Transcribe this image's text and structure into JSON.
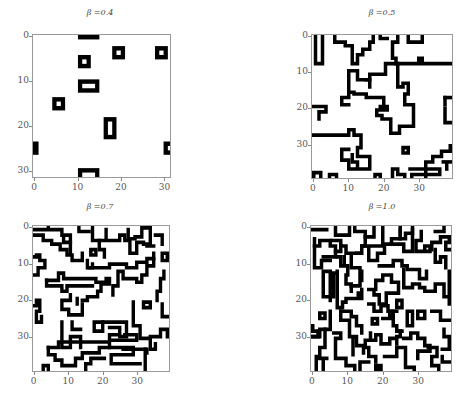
{
  "chart_data": [
    {
      "type": "heatmap",
      "title": "β =0.4",
      "grid_size": 32,
      "xlim": [
        0,
        31
      ],
      "ylim": [
        31,
        0
      ],
      "xticks": [
        "0",
        "10",
        "20",
        "30"
      ],
      "yticks": [
        "0",
        "10",
        "20",
        "30"
      ],
      "colormap": [
        "#ffffff",
        "#000000"
      ],
      "description": "Sparse isolated black rectangular domain walls on white background",
      "walls": [
        {
          "shape": "rect",
          "x": 10,
          "y": -1,
          "w": 5,
          "h": 1.5
        },
        {
          "shape": "rect",
          "x": 18,
          "y": 2,
          "w": 3,
          "h": 3
        },
        {
          "shape": "rect",
          "x": 28,
          "y": 2,
          "w": 3,
          "h": 3
        },
        {
          "shape": "rect",
          "x": 10,
          "y": 4,
          "w": 3,
          "h": 3
        },
        {
          "shape": "rect",
          "x": 10,
          "y": 9.5,
          "w": 5,
          "h": 3
        },
        {
          "shape": "rect",
          "x": 4,
          "y": 13.5,
          "w": 3,
          "h": 3
        },
        {
          "shape": "rect",
          "x": 16,
          "y": 18,
          "w": 3,
          "h": 5
        },
        {
          "shape": "rect",
          "x": -1,
          "y": 23.5,
          "w": 1.8,
          "h": 3
        },
        {
          "shape": "rect",
          "x": 30,
          "y": 23.5,
          "w": 3,
          "h": 3
        },
        {
          "shape": "rect",
          "x": 10,
          "y": 29.5,
          "w": 5,
          "h": 3
        }
      ]
    },
    {
      "type": "heatmap",
      "title": "β =0.5",
      "grid_size": 40,
      "xlim": [
        0,
        39
      ],
      "ylim": [
        39,
        0
      ],
      "xticks": [
        "0",
        "10",
        "20",
        "30"
      ],
      "yticks": [
        "0",
        "10",
        "20",
        "30"
      ],
      "colormap": [
        "#ffffff",
        "#000000"
      ],
      "description": "Larger connected domain wall network",
      "paths": [
        "M0.5,-1 V7.5 H2.5 V-1",
        "M6,-1 V1.5 H9 V2.5 H11 V7.5 H12.5 V5 H14 V3.5 H16 V1.5 H17 V-1",
        "M19,-1 V0.5 H21",
        "M24,-1 V1.5 H22.5 V6 H23.5 V7.5 H20.5 V10.5 H16 V12 H15",
        "M27,-1 V1.5 H31 V-1",
        "M23.5,7.5 H30 V6 H31 V7.5 H41",
        "M10,9.5 H12.5 V12 H16 V14",
        "M10,9.5 V17 H8 V19 H10",
        "M10,15.5 H11.5 V16 H15 V17 H20 V20",
        "M24,7.5 V14 H25.5 V13 H27 V16 H26 V19 H28.5 V25 H24.5 V27 H22 V23 H19.5 V22 H18 V20.5 H21 V19.5 H19",
        "M-1,16.5 V18",
        "M-1,19.5 H3.5 V21 H1.5 V23",
        "M-1,27.5 H10 V26 H11.5 V27.5 H13.5 V31 H12.5 V33.5 H16 V37 H10 V34.5 H8 V31.5 H10",
        "M11,33 V35 H12.5 V36.5",
        "M25.5,31 H27 V32.5 H25.5 Z",
        "M37.5,17 H41",
        "M37.5,17 V19",
        "M37.5,20 V24 H41",
        "M39,30.5 V32 H36.5 V33.5 H34 V35 H32 V40",
        "M37,35 H41",
        "M-1,35.5 V37",
        "M0,38.5 V40 M0,38 H2 V40",
        "M4.5,40 V38.5 H6.5 V40",
        "M17.5,40 V38.5 H19 V40",
        "M22.5,40 V37 H24 V38.5 H26 V40",
        "M27.5,37 H36 V38.5 H28 V40",
        "M38,35.5 V37"
      ]
    },
    {
      "type": "heatmap",
      "title": "β =0.7",
      "grid_size": 40,
      "xlim": [
        0,
        39
      ],
      "ylim": [
        39,
        0
      ],
      "xticks": [
        "0",
        "10",
        "20",
        "30"
      ],
      "yticks": [
        "0",
        "10",
        "20",
        "30"
      ],
      "colormap": [
        "#ffffff",
        "#000000"
      ],
      "description": "Dense domain wall network",
      "paths": [
        "M-1,0.5 H3 M4,-1 V0.5 H8 V2",
        "M0,2 H2.5 V3.5 H5 V4.5 H7.5 V6 H9.5 V7.5 H11 V9 H14 V7",
        "M8.5,2 V4 H10.5 V2 H8.5",
        "M10.5,4 V7 M13,-1 V1 H16",
        "M17,0 V3.5 H19 V6 H20.5 V8",
        "M19,3.5 H21 V0.5 M21,3.5 H25 V2 H26.5 V3.5 H28 V7 H30 V4 H32",
        "M27.5,0.5 V3 H29.5 V2.5 H31.5 V0 H34 V2 M33,5 H35 M34,2 V4.5 H32",
        "M35.5,2 H37.5 V4.5",
        "M-1,8 H0.5 V7.5 H1.5 V9 H3 V11 H1 V13 H-1",
        "M16.5,6 H18 V7.5 H16.5 Z",
        "M15.5,9 V11 H17 V10",
        "M16,11 H22 V10 H27 V11 H30 V9.5 H33 V8.5 H35",
        "M35,7 V10.5 H33 V13 H31.5 V15 H30 V14 H26 V12 H24.5 V16 H23 V18.5",
        "M37.5,7 H39 V9 H37.5 Z",
        "M3.5,14.5 H7 V12.5 H8.5 V14 H18 V15 H21 V14 H22 V15.5 H19.5 V17.5 H18.5 V19 H15.5 V20 H14",
        "M3.5,14.5 V16 H8 V17.5 H9.5 V16 H17",
        "M38,12 V14 H37 V17.5 H36 V20",
        "M-1,21.5 H0.5 V20 H1.5 V23 H0.5 V26 H2 V24.5",
        "M8,20 H10.5 V18.5 M8,20 V22.5 H10 V24 H14 V21",
        "M12.5,19.5 V21",
        "M29,20.5 V27 H31 V30.5 H34 V33.5 H35.5 V32 M34,30 H37 V28 H39 V30",
        "M32,20.5 H34 V22 H32 Z",
        "M37.5,21 V24.5 H39",
        "M8,26 V33 H10.5 V30 H13.5 V33 M11,26 V28 H13.5",
        "M17.5,26 H20 V28.5 H17.5 Z",
        "M20,26 H27 V30 H25",
        "M22,27.5 H25 V29.5 H22 V31 H30 V29.5 H26.5",
        "M4,33 V35 H6 V36.5 H8 V38 H12 V36 H14 V34.5 H19 V33 H22",
        "M4,33 H7 V31.5 H22 V33 H29 V35 H22.5 V37.5 H31",
        "M26,33.5 H33 V34.5",
        "M32.5,33.5 V40",
        "M-1,30 V40",
        "M2.5,40 V38 H4 V40",
        "M15,40 V37.5 H16.5 V36 H20.5"
      ]
    },
    {
      "type": "heatmap",
      "title": "β =1.0",
      "grid_size": 40,
      "xlim": [
        0,
        39
      ],
      "ylim": [
        39,
        0
      ],
      "xticks": [
        "0",
        "10",
        "20",
        "30"
      ],
      "yticks": [
        "0",
        "10",
        "20",
        "30"
      ],
      "colormap": [
        "#ffffff",
        "#000000"
      ],
      "description": "Very dense labyrinthine domain wall network",
      "paths": [
        "M-1,0.5 H1 M2,0.5 H4",
        "M6.5,-1 V2 H10.5 V-1",
        "M12,-1 V1 H15 V2.5 H17.5 V-1",
        "M20,0 V4.5 H22.5 V3 H25 V0.5",
        "M25,-1 V3 H26.5 V1.5 H28.5 V0.5",
        "M22.5,4.5 H26 V6.5 H28.5 V0",
        "M35,1 H37.5 V-1",
        "M0.5,3 V5 H2 V3.5 H5 V5 H6.5 V8 H3",
        "M0.5,5 V11 H2.5 V9 H5",
        "M5.5,3.5 H8 V5 H9.5 V7 H13",
        "M8,5 V6.5 H6.5 M15,2.5 V5 H14 V7 H12.5",
        "M14,5 H16 V9 H18.5 V7 H20.5 V5 H17",
        "M31,1 V3.5 H29.5 V6.5 H32 V5 H33.5 V6.5 H32",
        "M34,6 V4 H36.5 V2.5 H39 V4 H38 V6 H39",
        "M35,6 V9.5 H36.5 V8 H38 V11",
        "M7,8 H8 V10.5 H10 V13 H9.5 V15.5 H11 V17.5",
        "M9,8 V9.5 M11,8 V11 H13.5 V16 H11",
        "M3,12 V19 H5 V12 Z",
        "M5,20 V19 H6 V12.5 H7",
        "M7,12 V22 H8.5 V20.5 H9.5 V19.5 H13 V18",
        "M14,12 V14.5",
        "M19,10.5 H23 V9 H25.5 V10.5 H27 V11.5 H30.5 V14 H32.5 V12 M32.5,14 V12.5",
        "M14,19.5 V17 M16,17 H18 V14.5 H20 V13 H22.5 V15 H24.5 V18 H21 V21 H19 V18.5 H17.5 V17",
        "M26,11.5 V16.5 H28.5 V15.5 H30.5 V16.5 H32 V17.5 H35 V15.5 H37.5 V19 H39",
        "M39,12 V21",
        "M-1,18 V28",
        "M2,23.5 H3.5 V25 H2 Z",
        "M5,23 V28 H2 V30 H-1",
        "M8,23 H11 V24.5 H12.5 V27 H14 V29",
        "M8,23 V25.5 H10.5 V30 H12.5 V32.5 H14.5 V34.5",
        "M16,21 H17.5 V23 H19.5 V21.5 H21.5 V23 H24",
        "M24,20 V22 H25.5 V20 Z",
        "M17,25 H18.5 V26.5 H17 Z",
        "M20,25 H22 V23 H23 V27 H24 V28.5 H25.5",
        "M27,23 H28.5 V27 H27 Z",
        "M30,23 H32 V25 H30 Z",
        "M34,23 H36.5 V25.5 H39",
        "M0,27 V28.5 H1.5 V30 H0",
        "M3.5,28 V33 H2 V36 H4",
        "M-1,32 V40",
        "M6,29 H8 V30.5 H6.5 V36 H9.5 V38 H12 V40",
        "M11.5,30.5 V35",
        "M16.5,29 V31 H15 V33 H16 V35.5 H18 V37 M16.5,31 H18 V29.5 H19.5 V32 H22 V30.5 H24 V32",
        "M24,30 H25 V28.5 M26,30.5 H28 V29 H30 V30.5 H32 V32.5 H33.5 V34 H30 V36",
        "M20.5,35.5 H24 V33 H26.5 V38.5 H29 V40",
        "M33,33 H35.5 V35.5 H34 V38 H36 V40",
        "M37,33.5 H39 V30 H37.5 V28",
        "M37,35.5 V37 H39.5",
        "M1,40 V35.5 M3,40 V36.5",
        "M13.5,40 V37 H16",
        "M18,38 H19.5 V39 H18 Z"
      ]
    }
  ],
  "panels": [
    {
      "title": "β =0.4",
      "yticks": [
        "0",
        "10",
        "20",
        "30"
      ],
      "xticks": [
        "0",
        "10",
        "20",
        "30"
      ]
    },
    {
      "title": "β =0.5",
      "yticks": [
        "0",
        "10",
        "20",
        "30"
      ],
      "xticks": [
        "0",
        "10",
        "20",
        "30"
      ]
    },
    {
      "title": "β =0.7",
      "yticks": [
        "0",
        "10",
        "20",
        "30"
      ],
      "xticks": [
        "0",
        "10",
        "20",
        "30"
      ]
    },
    {
      "title": "β =1.0",
      "yticks": [
        "0",
        "10",
        "20",
        "30"
      ],
      "xticks": [
        "0",
        "10",
        "20",
        "30"
      ]
    }
  ]
}
